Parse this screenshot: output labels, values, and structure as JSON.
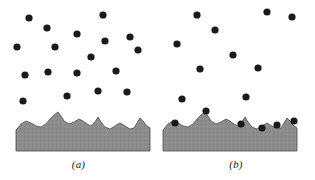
{
  "figure": {
    "background_color": "#ffffff",
    "width": 315,
    "height": 180
  },
  "style": {
    "particle_color": "#1a1a1a",
    "particle_radius": 3.6,
    "surface_fill": "#8c8c8c",
    "surface_stroke": "#4d4d4d",
    "surface_stroke_width": 0.8,
    "caption_color": "#1a1a1a"
  },
  "panels": [
    {
      "id": "a",
      "caption": "(a)",
      "origin_x": 0,
      "slab": {
        "left": 16,
        "right": 150,
        "bottom": 151,
        "profile": "M16,130 L21,124 L26,121 L31,123 L36,126 L41,127 L46,124 L50,119 L54,115 L58,112 L61,116 L64,121 L69,124 L74,122 L79,119 L83,121 L87,124 L91,126 L95,122 L98,117 L101,122 L105,127 L110,129 L115,126 L120,123 L125,126 L130,129 L134,128 L137,123 L140,118 L143,121 L146,125 L150,128 L150,151 L16,151 Z"
      },
      "free_particles": [
        {
          "x": 29,
          "y": 18
        },
        {
          "x": 47,
          "y": 28
        },
        {
          "x": 103,
          "y": 15
        },
        {
          "x": 77,
          "y": 34
        },
        {
          "x": 17,
          "y": 47
        },
        {
          "x": 55,
          "y": 47
        },
        {
          "x": 105,
          "y": 41
        },
        {
          "x": 130,
          "y": 37
        },
        {
          "x": 138,
          "y": 50
        },
        {
          "x": 91,
          "y": 57
        },
        {
          "x": 25,
          "y": 75
        },
        {
          "x": 48,
          "y": 72
        },
        {
          "x": 77,
          "y": 73
        },
        {
          "x": 116,
          "y": 71
        },
        {
          "x": 23,
          "y": 101
        },
        {
          "x": 67,
          "y": 96
        },
        {
          "x": 98,
          "y": 91
        },
        {
          "x": 127,
          "y": 92
        }
      ],
      "adsorbed_particles": []
    },
    {
      "id": "b",
      "caption": "(b)",
      "origin_x": 157,
      "slab": {
        "left": 6,
        "right": 140,
        "bottom": 151,
        "profile": "M6,130 L11,124 L16,121 L21,123 L26,126 L31,127 L36,124 L40,119 L44,115 L48,112 L51,116 L54,121 L59,124 L64,122 L69,119 L73,121 L77,124 L81,126 L85,122 L88,117 L91,122 L95,127 L100,129 L105,126 L110,123 L115,126 L120,129 L124,128 L127,123 L130,118 L133,121 L136,125 L140,128 L140,151 L6,151 Z"
      },
      "free_particles": [
        {
          "x": 40,
          "y": 15
        },
        {
          "x": 110,
          "y": 12
        },
        {
          "x": 135,
          "y": 17
        },
        {
          "x": 58,
          "y": 30
        },
        {
          "x": 20,
          "y": 44
        },
        {
          "x": 76,
          "y": 55
        },
        {
          "x": 43,
          "y": 69
        },
        {
          "x": 101,
          "y": 68
        },
        {
          "x": 25,
          "y": 99
        },
        {
          "x": 89,
          "y": 97
        }
      ],
      "adsorbed_particles": [
        {
          "x": 18,
          "y": 123
        },
        {
          "x": 49,
          "y": 111
        },
        {
          "x": 84,
          "y": 124
        },
        {
          "x": 105,
          "y": 128
        },
        {
          "x": 120,
          "y": 125
        },
        {
          "x": 137,
          "y": 121
        }
      ]
    }
  ],
  "chart_data": {
    "type": "scatter",
    "xlabel": "",
    "ylabel": "",
    "series": [
      {
        "name": "(a) free particles in suspension",
        "count": 18,
        "state": "suspended",
        "points": [
          [
            29,
            18
          ],
          [
            47,
            28
          ],
          [
            103,
            15
          ],
          [
            77,
            34
          ],
          [
            17,
            47
          ],
          [
            55,
            47
          ],
          [
            105,
            41
          ],
          [
            130,
            37
          ],
          [
            138,
            50
          ],
          [
            91,
            57
          ],
          [
            25,
            75
          ],
          [
            48,
            72
          ],
          [
            77,
            73
          ],
          [
            116,
            71
          ],
          [
            23,
            101
          ],
          [
            67,
            96
          ],
          [
            98,
            91
          ],
          [
            127,
            92
          ]
        ]
      },
      {
        "name": "(b) free particles in suspension",
        "count": 10,
        "state": "suspended",
        "points": [
          [
            40,
            15
          ],
          [
            110,
            12
          ],
          [
            135,
            17
          ],
          [
            58,
            30
          ],
          [
            20,
            44
          ],
          [
            76,
            55
          ],
          [
            43,
            69
          ],
          [
            101,
            68
          ],
          [
            25,
            99
          ],
          [
            89,
            97
          ]
        ]
      },
      {
        "name": "(b) particles adsorbed on surface asperities",
        "count": 6,
        "state": "adsorbed",
        "points": [
          [
            18,
            123
          ],
          [
            49,
            111
          ],
          [
            84,
            124
          ],
          [
            105,
            128
          ],
          [
            120,
            125
          ],
          [
            137,
            121
          ]
        ]
      }
    ]
  }
}
